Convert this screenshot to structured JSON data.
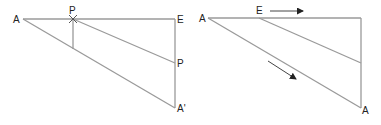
{
  "diagrams": [
    {
      "id": "left",
      "labels": {
        "A": "A",
        "P_top": "P",
        "E": "E",
        "P_right": "P",
        "A_prime": "A'"
      }
    },
    {
      "id": "right",
      "labels": {
        "A_left": "A",
        "E": "E",
        "A_bottom": "A"
      },
      "arrows": [
        "horizontal-right",
        "diagonal-down-right"
      ]
    }
  ],
  "colors": {
    "lines": "#9a9a9a",
    "text": "#222222",
    "arrows": "#444444"
  }
}
